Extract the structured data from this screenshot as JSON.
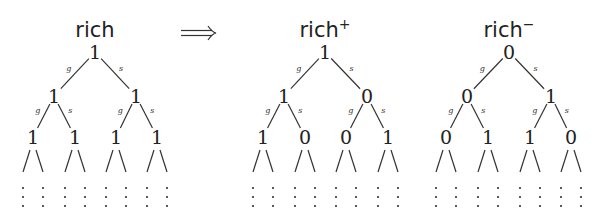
{
  "arrow": {
    "symbol": "⟹",
    "x1": 181,
    "x2": 216,
    "y": 33
  },
  "edge_labels": {
    "left": "g",
    "right": "s"
  },
  "trees": [
    {
      "name": "rich",
      "superscript": "",
      "title_x": 95,
      "root": {
        "x": 95,
        "value": "1"
      },
      "level1": [
        {
          "x": 54,
          "value": "1"
        },
        {
          "x": 136,
          "value": "1"
        }
      ],
      "level2": [
        {
          "x": 33,
          "value": "1"
        },
        {
          "x": 75,
          "value": "1"
        },
        {
          "x": 116,
          "value": "1"
        },
        {
          "x": 157,
          "value": "1"
        }
      ]
    },
    {
      "name": "rich",
      "superscript": "+",
      "title_x": 325,
      "root": {
        "x": 325,
        "value": "1"
      },
      "level1": [
        {
          "x": 284,
          "value": "1"
        },
        {
          "x": 367,
          "value": "0"
        }
      ],
      "level2": [
        {
          "x": 263,
          "value": "1"
        },
        {
          "x": 305,
          "value": "0"
        },
        {
          "x": 346,
          "value": "0"
        },
        {
          "x": 388,
          "value": "1"
        }
      ]
    },
    {
      "name": "rich",
      "superscript": "−",
      "title_x": 509,
      "root": {
        "x": 509,
        "value": "0"
      },
      "level1": [
        {
          "x": 467,
          "value": "0"
        },
        {
          "x": 551,
          "value": "1"
        }
      ],
      "level2": [
        {
          "x": 446,
          "value": "0"
        },
        {
          "x": 488,
          "value": "1"
        },
        {
          "x": 530,
          "value": "1"
        },
        {
          "x": 571,
          "value": "0"
        }
      ]
    }
  ],
  "layout": {
    "title_y": 37,
    "root_y": 52,
    "level1_y": 96,
    "level2_y": 137,
    "leaf_top": 150,
    "leaf_bottom": 172,
    "leaf_spread": 10,
    "dot_rows": [
      188,
      197,
      206
    ]
  },
  "colors": {
    "ink": "#222222",
    "background": "#ffffff"
  }
}
